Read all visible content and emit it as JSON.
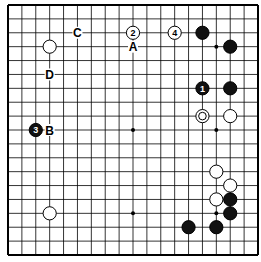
{
  "diagram": {
    "type": "go-board",
    "size": 19,
    "colors": {
      "background": "#ffffff",
      "line": "#000000",
      "black_stone": "#111111",
      "white_stone": "#ffffff"
    },
    "hoshi": [
      [
        3,
        3
      ],
      [
        9,
        3
      ],
      [
        15,
        3
      ],
      [
        3,
        9
      ],
      [
        9,
        9
      ],
      [
        15,
        9
      ],
      [
        3,
        15
      ],
      [
        9,
        15
      ],
      [
        15,
        15
      ]
    ],
    "stones": [
      {
        "col": 9,
        "row": 2,
        "color": "white",
        "label": "2"
      },
      {
        "col": 12,
        "row": 2,
        "color": "white",
        "label": "4"
      },
      {
        "col": 14,
        "row": 2,
        "color": "black",
        "label": ""
      },
      {
        "col": 16,
        "row": 3,
        "color": "black",
        "label": ""
      },
      {
        "col": 3,
        "row": 3,
        "color": "white",
        "label": ""
      },
      {
        "col": 14,
        "row": 6,
        "color": "black",
        "label": "1"
      },
      {
        "col": 16,
        "row": 6,
        "color": "black",
        "label": ""
      },
      {
        "col": 14,
        "row": 8,
        "color": "white",
        "label": "",
        "marker": "circle"
      },
      {
        "col": 16,
        "row": 8,
        "color": "white",
        "label": ""
      },
      {
        "col": 2,
        "row": 9,
        "color": "black",
        "label": "3"
      },
      {
        "col": 15,
        "row": 12,
        "color": "white",
        "label": ""
      },
      {
        "col": 16,
        "row": 13,
        "color": "white",
        "label": ""
      },
      {
        "col": 15,
        "row": 14,
        "color": "white",
        "label": ""
      },
      {
        "col": 16,
        "row": 14,
        "color": "black",
        "label": ""
      },
      {
        "col": 16,
        "row": 15,
        "color": "black",
        "label": ""
      },
      {
        "col": 13,
        "row": 16,
        "color": "black",
        "label": ""
      },
      {
        "col": 15,
        "row": 16,
        "color": "black",
        "label": ""
      },
      {
        "col": 3,
        "row": 15,
        "color": "white",
        "label": ""
      }
    ],
    "letters": [
      {
        "col": 9,
        "row": 3,
        "text": "A"
      },
      {
        "col": 3,
        "row": 9,
        "text": "B"
      },
      {
        "col": 5,
        "row": 2,
        "text": "C"
      },
      {
        "col": 3,
        "row": 5,
        "text": "D"
      }
    ]
  }
}
